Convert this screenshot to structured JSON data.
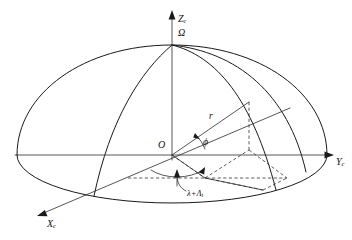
{
  "diagram": {
    "background_color": "#ffffff",
    "line_color": "#1a1a1a",
    "axes": {
      "z": {
        "name": "Z-axis",
        "symbol": "Z",
        "subscript": "c",
        "label": "Zc",
        "direction": "up"
      },
      "y": {
        "name": "Y-axis",
        "symbol": "Y",
        "subscript": "c",
        "label": "Yc",
        "direction": "right"
      },
      "x": {
        "name": "X-axis",
        "symbol": "X",
        "subscript": "c",
        "label": "Xc",
        "direction": "down-left"
      }
    },
    "points": {
      "origin": {
        "label": "O",
        "name": "origin-point"
      },
      "pole": {
        "label": "Ω",
        "name": "pole-point",
        "description": "omega"
      }
    },
    "vectors": {
      "radius": {
        "label": "r",
        "name": "radius-vector"
      }
    },
    "angles": {
      "elevation": {
        "label": "ϕ",
        "name": "phi-angle",
        "description": "phi elevation angle from equatorial plane"
      },
      "azimuth": {
        "prefix": "λ+Λ",
        "subscript": "t",
        "label": "λ+Λt",
        "name": "azimuth-angle",
        "description": "lambda plus Lambda sub t"
      }
    }
  }
}
